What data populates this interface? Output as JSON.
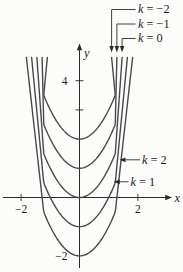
{
  "chart_data": {
    "type": "line",
    "title": "",
    "equation_family": "y = x^2 − k",
    "k_values": [
      -2,
      -1,
      0,
      1,
      2
    ],
    "series": [
      {
        "name": "k = −2",
        "k": -2,
        "vertex": [
          0,
          2
        ],
        "points": [
          [
            -2,
            6
          ],
          [
            -1,
            3
          ],
          [
            0,
            2
          ],
          [
            1,
            3
          ],
          [
            2,
            6
          ]
        ]
      },
      {
        "name": "k = −1",
        "k": -1,
        "vertex": [
          0,
          1
        ],
        "points": [
          [
            -2,
            5
          ],
          [
            -1,
            2
          ],
          [
            0,
            1
          ],
          [
            1,
            2
          ],
          [
            2,
            5
          ]
        ]
      },
      {
        "name": "k = 0",
        "k": 0,
        "vertex": [
          0,
          0
        ],
        "points": [
          [
            -2,
            4
          ],
          [
            -1,
            1
          ],
          [
            0,
            0
          ],
          [
            1,
            1
          ],
          [
            2,
            4
          ]
        ]
      },
      {
        "name": "k = 1",
        "k": 1,
        "vertex": [
          0,
          -1
        ],
        "points": [
          [
            -2,
            3
          ],
          [
            -1,
            0
          ],
          [
            0,
            -1
          ],
          [
            1,
            0
          ],
          [
            2,
            3
          ]
        ]
      },
      {
        "name": "k = 2",
        "k": 2,
        "vertex": [
          0,
          -2
        ],
        "points": [
          [
            -2,
            2
          ],
          [
            -1,
            -1
          ],
          [
            0,
            -2
          ],
          [
            1,
            -1
          ],
          [
            2,
            2
          ]
        ]
      }
    ],
    "xlabel": "x",
    "ylabel": "y",
    "x_ticks": [
      {
        "value": -2,
        "label": "−2"
      },
      {
        "value": 2,
        "label": "2"
      }
    ],
    "y_ticks": [
      {
        "value": 4,
        "label": "4",
        "mark": true
      },
      {
        "value": 3,
        "label": "",
        "mark": true
      },
      {
        "value": -2,
        "label": "−2",
        "mark": false
      }
    ],
    "xlim": [
      -2.7,
      2.95
    ],
    "ylim": [
      -2.6,
      5.3
    ],
    "grid": false,
    "legend_position": "none",
    "annotations": [
      {
        "text": "k = −2",
        "k": -2,
        "placement": "top"
      },
      {
        "text": "k = −1",
        "k": -1,
        "placement": "top"
      },
      {
        "text": "k = 0",
        "k": 0,
        "placement": "top"
      },
      {
        "text": "k = 2",
        "k": 2,
        "placement": "right"
      },
      {
        "text": "k = 1",
        "k": 1,
        "placement": "right"
      }
    ],
    "colors": {
      "curve": "#4a4a4a",
      "axis": "#2b2b2b",
      "text": "#1c1c1c",
      "background": "#fcfcfb"
    }
  }
}
